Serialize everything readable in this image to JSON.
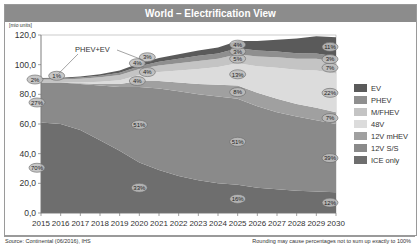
{
  "chart_data": {
    "type": "area",
    "stacked": true,
    "title": "World – Electrification View",
    "ylabel": "[mio units]",
    "xlabel": "",
    "ylim": [
      0,
      120
    ],
    "yticks": [
      "0,0",
      "20,0",
      "40,0",
      "60,0",
      "80,0",
      "100,0",
      "120,0"
    ],
    "x": [
      2015,
      2016,
      2017,
      2018,
      2019,
      2020,
      2021,
      2022,
      2023,
      2024,
      2025,
      2026,
      2027,
      2028,
      2029,
      2030
    ],
    "series": [
      {
        "name": "ICE only",
        "color": "#6e6e6e",
        "values": [
          61,
          60,
          56,
          49,
          42,
          34,
          29,
          25,
          22,
          20,
          19,
          17,
          16,
          15,
          14.5,
          14
        ]
      },
      {
        "name": "12V S/S",
        "color": "#8a8a8a",
        "values": [
          27,
          28,
          31,
          37,
          43,
          51,
          55,
          57,
          58,
          58.5,
          58,
          55,
          52,
          50,
          48,
          46
        ]
      },
      {
        "name": "12V mHEV",
        "color": "#a0a0a0",
        "values": [
          0,
          0,
          0.5,
          1,
          2,
          4,
          5,
          6,
          7,
          8,
          9,
          9,
          9,
          8.5,
          8.5,
          8
        ]
      },
      {
        "name": "48V",
        "color": "#dcdcdc",
        "values": [
          0,
          0,
          0.5,
          1.5,
          2.5,
          4,
          6,
          8,
          10,
          12,
          15,
          18,
          21,
          23,
          25,
          26
        ]
      },
      {
        "name": "M/FHEV",
        "color": "#c4c4c4",
        "values": [
          2,
          2,
          2.5,
          3,
          3.5,
          4,
          4.5,
          5,
          5.5,
          5.5,
          6,
          6.5,
          7,
          7.5,
          8,
          8
        ]
      },
      {
        "name": "PHEV",
        "color": "#8f8f8f",
        "values": [
          0.5,
          0.6,
          0.8,
          1,
          1.5,
          2,
          2.5,
          3,
          3.5,
          3.5,
          4,
          4,
          3.8,
          3.7,
          3.6,
          3.5
        ]
      },
      {
        "name": "EV",
        "color": "#5a5a5a",
        "values": [
          0.5,
          0.6,
          0.8,
          1,
          1.5,
          2,
          2.5,
          3,
          3.5,
          4,
          5,
          6.5,
          8,
          10,
          11.5,
          13
        ]
      }
    ],
    "annotations": [
      {
        "text": "PHEV+EV",
        "year": 2016
      },
      {
        "year": 2015,
        "labels": {
          "ICE only": "70%",
          "12V S/S": "27%",
          "M/FHEV": "2%",
          "PHEV+EV": "1%"
        }
      },
      {
        "year": 2020,
        "labels": {
          "ICE only": "33%",
          "12V S/S": "51%",
          "12V mHEV": "4%",
          "48V": "4%",
          "M/FHEV": "4%",
          "PHEV+EV": "3%"
        }
      },
      {
        "year": 2025,
        "labels": {
          "ICE only": "16%",
          "12V S/S": "51%",
          "12V mHEV": "8%",
          "48V": "13%",
          "M/FHEV": "5%",
          "PHEV": "3%",
          "EV": "4%"
        }
      },
      {
        "year": 2030,
        "labels": {
          "ICE only": "12%",
          "12V S/S": "39%",
          "12V mHEV": "7%",
          "48V": "22%",
          "M/FHEV": "7%",
          "PHEV": "3%",
          "EV": "11%"
        }
      }
    ],
    "legend_position": "right",
    "grid": false
  },
  "header": {
    "title": "World – Electrification View"
  },
  "axis": {
    "unit": "[mio units]"
  },
  "legend": [
    {
      "label": "EV",
      "color": "#5a5a5a"
    },
    {
      "label": "PHEV",
      "color": "#8f8f8f"
    },
    {
      "label": "M/FHEV",
      "color": "#c4c4c4"
    },
    {
      "label": "48V",
      "color": "#dcdcdc"
    },
    {
      "label": "12V mHEV",
      "color": "#a0a0a0"
    },
    {
      "label": "12V S/S",
      "color": "#8a8a8a"
    },
    {
      "label": "ICE only",
      "color": "#6e6e6e"
    }
  ],
  "footer": {
    "source": "Source: Continental (06/2016), IHS",
    "note": "Rounding may cause percentages not to sum up exactly to 100%"
  }
}
